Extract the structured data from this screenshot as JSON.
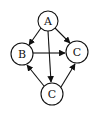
{
  "diagram": {
    "type": "directed-graph",
    "nodes": [
      {
        "id": "A",
        "label": "A",
        "cx": 48,
        "cy": 21,
        "r": 10
      },
      {
        "id": "B",
        "label": "B",
        "cx": 22,
        "cy": 54,
        "r": 11
      },
      {
        "id": "C1",
        "label": "C",
        "cx": 77,
        "cy": 52,
        "r": 11
      },
      {
        "id": "C2",
        "label": "C",
        "cx": 52,
        "cy": 94,
        "r": 11
      }
    ],
    "edges": [
      {
        "from": "A",
        "to": "B"
      },
      {
        "from": "A",
        "to": "C1"
      },
      {
        "from": "A",
        "to": "C2"
      },
      {
        "from": "B",
        "to": "C1"
      },
      {
        "from": "C2",
        "to": "B"
      },
      {
        "from": "C2",
        "to": "C1"
      }
    ],
    "colors": {
      "stroke": "#111111",
      "fill": "#ffffff"
    }
  }
}
